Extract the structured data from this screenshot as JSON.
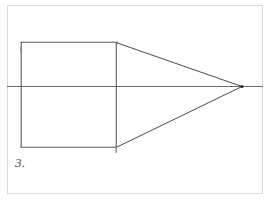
{
  "figure": {
    "label": "3.",
    "caption_number": "3",
    "background_color": "#ffffff",
    "frame": {
      "name": "page-border",
      "x": 7,
      "y": 5,
      "width": 256,
      "height": 189,
      "stroke": "#d8d8d8",
      "stroke_width": 1
    },
    "horizon_line": {
      "name": "horizon-line",
      "x1": 7,
      "y1": 86,
      "x2": 263,
      "y2": 86,
      "stroke": "#6b6b6b",
      "stroke_width": 1
    },
    "vanishing_point": {
      "name": "vanishing-point",
      "cx": 242,
      "cy": 86,
      "r": 1.6,
      "fill": "#2a2a2a"
    },
    "front_face": {
      "name": "front-face-square",
      "x": 21,
      "y": 42,
      "width": 95,
      "height": 105,
      "stroke": "#5a5a5a",
      "stroke_width": 1.1,
      "corners": {
        "top_left": [
          21,
          42
        ],
        "top_right": [
          116,
          42
        ],
        "bottom_right": [
          116,
          147
        ],
        "bottom_left": [
          21,
          147
        ]
      }
    },
    "receding_lines": [
      {
        "name": "receding-line-top",
        "x1": 116,
        "y1": 42,
        "x2": 242,
        "y2": 86,
        "stroke": "#4a4a4a",
        "stroke_width": 1
      },
      {
        "name": "receding-line-bottom",
        "x1": 116,
        "y1": 147,
        "x2": 242,
        "y2": 86,
        "stroke": "#4a4a4a",
        "stroke_width": 1
      },
      {
        "name": "receding-line-center",
        "x1": 21,
        "y1": 86,
        "x2": 242,
        "y2": 86,
        "stroke": "#6b6b6b",
        "stroke_width": 1
      }
    ],
    "overshoot_marks": [
      {
        "name": "right-edge-overshoot",
        "x1": 116,
        "y1": 147,
        "x2": 116,
        "y2": 153,
        "stroke": "#9a9a9a",
        "stroke_width": 1
      },
      {
        "name": "left-edge-tick",
        "x1": 21,
        "y1": 47,
        "x2": 21,
        "y2": 53,
        "stroke": "#8a8a8a",
        "stroke_width": 1.8
      }
    ],
    "colors": {
      "ink": "#4a4a4a",
      "light_ink": "#6b6b6b",
      "frame": "#d8d8d8",
      "paper": "#ffffff"
    }
  }
}
